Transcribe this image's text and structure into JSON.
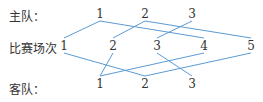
{
  "labels": {
    "home": "主队：",
    "match": "比赛场次",
    "away": "客队："
  },
  "home_nodes": [
    {
      "label": "1",
      "x": 100,
      "y": 14
    },
    {
      "label": "2",
      "x": 145,
      "y": 14
    },
    {
      "label": "3",
      "x": 192,
      "y": 14
    }
  ],
  "match_nodes": [
    {
      "label": "1",
      "x": 64,
      "y": 46
    },
    {
      "label": "2",
      "x": 113,
      "y": 46
    },
    {
      "label": "3",
      "x": 157,
      "y": 46
    },
    {
      "label": "4",
      "x": 204,
      "y": 46
    },
    {
      "label": "5",
      "x": 251,
      "y": 46
    }
  ],
  "away_nodes": [
    {
      "label": "1",
      "x": 100,
      "y": 82
    },
    {
      "label": "2",
      "x": 145,
      "y": 82
    },
    {
      "label": "3",
      "x": 192,
      "y": 82
    }
  ],
  "edges": {
    "color": "#5b9bd5",
    "home_to_match": [
      [
        1,
        1
      ],
      [
        1,
        4
      ],
      [
        2,
        2
      ],
      [
        2,
        5
      ],
      [
        3,
        3
      ]
    ],
    "away_to_match": [
      [
        1,
        2
      ],
      [
        1,
        4
      ],
      [
        2,
        1
      ],
      [
        2,
        5
      ],
      [
        3,
        3
      ]
    ]
  }
}
